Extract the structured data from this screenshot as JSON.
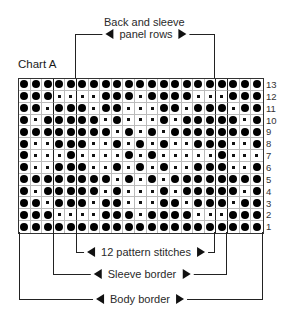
{
  "chart": {
    "title": "Chart A",
    "top_label": {
      "line1": "Back and sleeve",
      "line2": "panel rows"
    },
    "bottom_labels": {
      "pattern": "12 pattern stitches",
      "sleeve": "Sleeve border",
      "body": "Body border"
    },
    "legend_symbols": {
      "dot": "filled circle stitch",
      "dash": "small dash stitch"
    },
    "columns": 21,
    "row_numbers": [
      "13",
      "12",
      "11",
      "10",
      "9",
      "8",
      "7",
      "6",
      "5",
      "4",
      "3",
      "2",
      "1"
    ],
    "rows": [
      "●●●●●●●●●●●●●●●●●●●●●",
      "●●●----●●●-●●●●---●●●",
      "●●-●●●-●●---●●-●●●-●●",
      "●-●●●●●-●---●-●●●●●-●",
      "●●●●●●●●-●-●-●●●●●●●●",
      "●--●●●--●-●-●--●●●--●",
      "●---●----●-●-----●---●",
      "●--●●●--●-●-●--●●●--●",
      "●●●●●●●●-●-●-●●●●●●●●",
      "●-●●●●●-●---●-●●●●●-●",
      "●●-●●●-●●---●●-●●●-●●",
      "●●●----●●●-●●●●---●●●",
      "●●●●●●●●●●●●●●●●●●●●●"
    ]
  }
}
